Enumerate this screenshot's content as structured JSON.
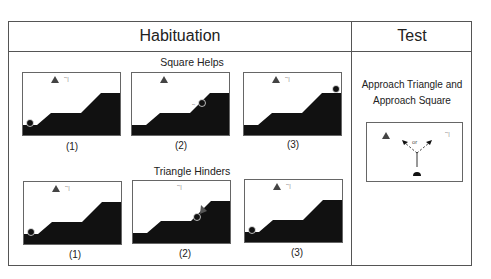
{
  "header": {
    "habituation_title": "Habituation",
    "test_title": "Test"
  },
  "habituation": {
    "rows": [
      {
        "title": "Square Helps",
        "frames": [
          {
            "caption": "(1)",
            "ball_position": "bottom-left",
            "agents": [
              "triangle",
              "square"
            ]
          },
          {
            "caption": "(2)",
            "ball_position": "mid-slope",
            "agents": [
              "triangle",
              "square-pushing-up"
            ]
          },
          {
            "caption": "(3)",
            "ball_position": "top-right",
            "agents": [
              "triangle",
              "square"
            ]
          }
        ]
      },
      {
        "title": "Triangle Hinders",
        "frames": [
          {
            "caption": "(1)",
            "ball_position": "bottom-left",
            "agents": [
              "triangle",
              "square"
            ]
          },
          {
            "caption": "(2)",
            "ball_position": "mid-slope",
            "agents": [
              "square",
              "triangle-pushing-down"
            ]
          },
          {
            "caption": "(3)",
            "ball_position": "bottom-left",
            "agents": [
              "triangle",
              "square"
            ]
          }
        ]
      }
    ]
  },
  "test": {
    "line1": "Approach Triangle and",
    "line2": "Approach Square",
    "choice_label": "or"
  }
}
